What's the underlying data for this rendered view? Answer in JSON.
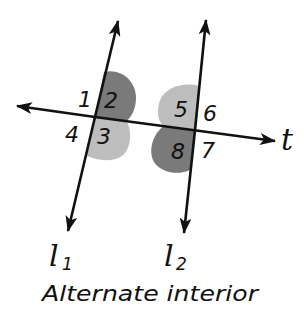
{
  "diagram": {
    "title": "Alternate interior",
    "caption": "Alternate interior",
    "colors": {
      "background": "#ffffff",
      "line": "#111111",
      "dark_region": "#7a7a7a",
      "light_region": "#bdbdbd",
      "text": "#111111"
    },
    "lines": {
      "l1": {
        "name": "l",
        "subscript": "1"
      },
      "l2": {
        "name": "l",
        "subscript": "2"
      },
      "transversal": {
        "name": "t"
      }
    },
    "angles": [
      {
        "label": "1",
        "position": "upper-left at l1",
        "shaded": "none"
      },
      {
        "label": "2",
        "position": "upper-right at l1",
        "shaded": "dark"
      },
      {
        "label": "3",
        "position": "lower-right at l1",
        "shaded": "light"
      },
      {
        "label": "4",
        "position": "lower-left at l1",
        "shaded": "none"
      },
      {
        "label": "5",
        "position": "upper-left at l2",
        "shaded": "light"
      },
      {
        "label": "6",
        "position": "upper-right at l2",
        "shaded": "none"
      },
      {
        "label": "7",
        "position": "lower-right at l2",
        "shaded": "none"
      },
      {
        "label": "8",
        "position": "lower-left at l2",
        "shaded": "dark"
      }
    ]
  }
}
